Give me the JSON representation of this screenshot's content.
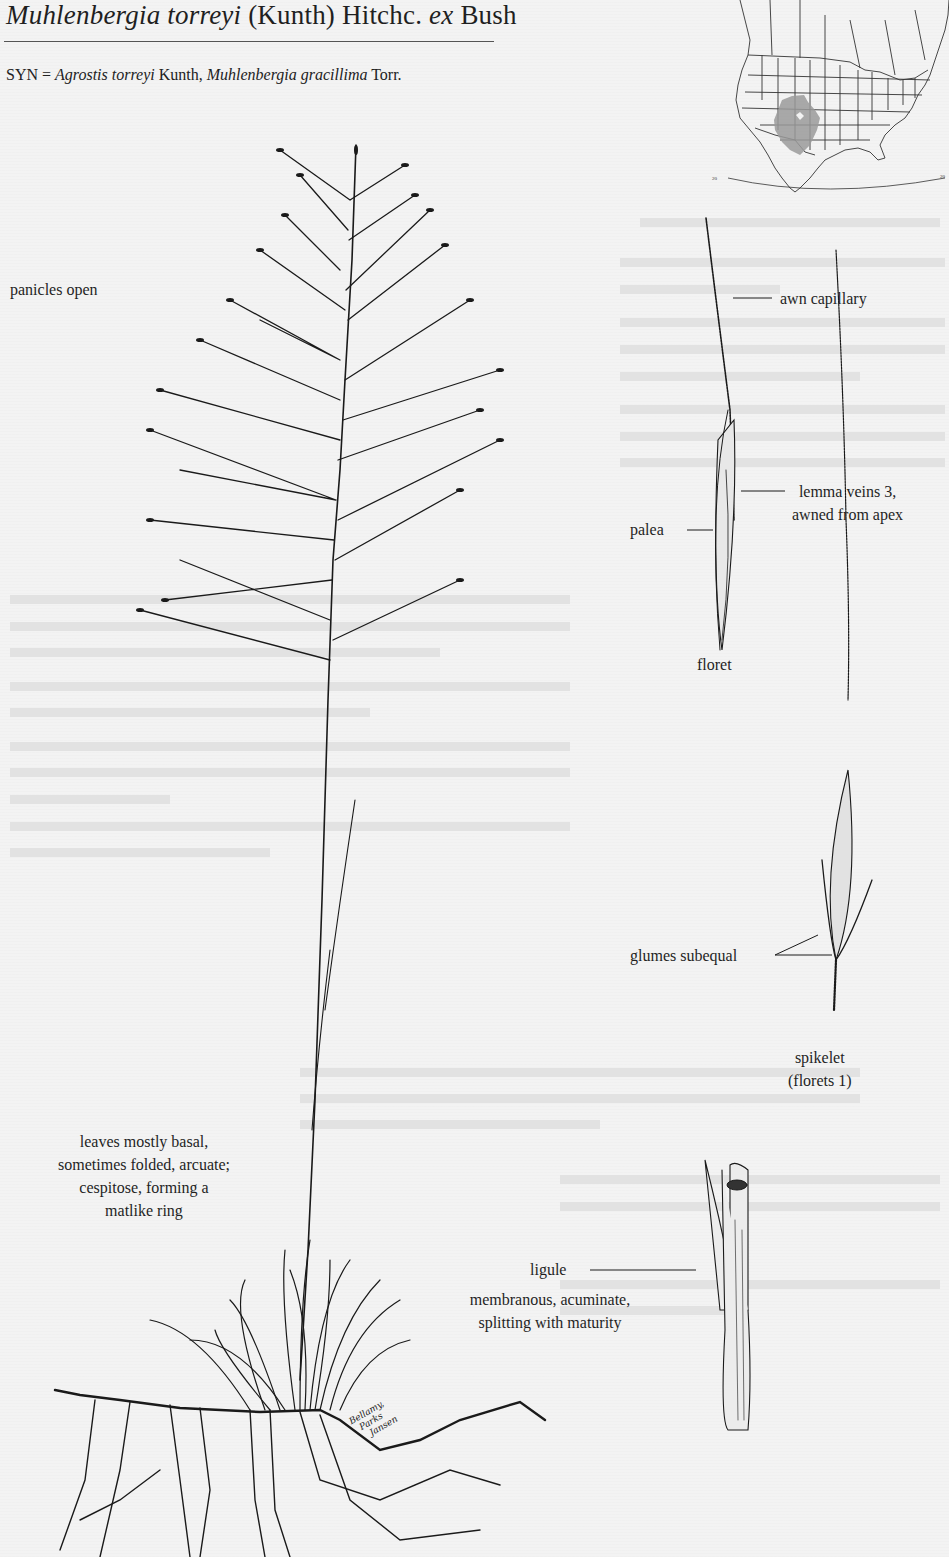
{
  "header": {
    "genus_species": "Muhlenbergia torreyi",
    "authority_1": " (Kunth) Hitchc. ",
    "ex": "ex",
    "authority_2": " Bush"
  },
  "synonyms": {
    "prefix": "SYN = ",
    "syn1_name": "Agrostis torreyi",
    "syn1_author": " Kunth, ",
    "syn2_name": "Muhlenbergia gracillima",
    "syn2_author": " Torr."
  },
  "map": {
    "region": "North America",
    "latitude_label_left": "20",
    "latitude_label_right": "20",
    "range_fill_color": "#9a9a9a"
  },
  "annotations": {
    "panicles": "panicles open",
    "awn": "awn capillary",
    "lemma_line1": "lemma veins 3,",
    "lemma_line2": "awned from apex",
    "palea": "palea",
    "floret": "floret",
    "glumes": "glumes subequal",
    "spikelet_line1": "spikelet",
    "spikelet_line2": "(florets 1)",
    "leaves_line1": "leaves mostly basal,",
    "leaves_line2": "sometimes folded, arcuate;",
    "leaves_line3": "cespitose, forming a",
    "leaves_line4": "matlike ring",
    "ligule": "ligule",
    "ligule_desc_line1": "membranous, acuminate,",
    "ligule_desc_line2": "splitting with maturity"
  },
  "signature": {
    "line1": "Bellamy,",
    "line2": "Parks",
    "line3": "Jansen"
  },
  "colors": {
    "ink": "#1a1a1a",
    "paper": "#f3f3f3",
    "range_shading": "#9a9a9a"
  }
}
